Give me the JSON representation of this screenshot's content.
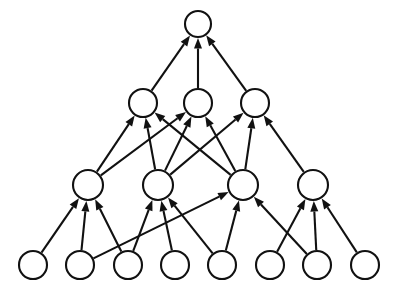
{
  "diagram": {
    "title": "",
    "type": "layered-directed-graph",
    "canvas": {
      "width": 396,
      "height": 288,
      "background": "#ffffff"
    },
    "style": {
      "node_fill": "#ffffff",
      "node_stroke": "#111111",
      "node_stroke_width": 2.1,
      "edge_color": "#111111",
      "edge_width": 2.1,
      "arrowhead": "filled-triangle"
    },
    "layers": [
      {
        "name": "output-layer",
        "index": 3,
        "y": 24,
        "radius": 13,
        "nodes": [
          {
            "id": "L3N1",
            "label": "",
            "x": 198,
            "y": 24,
            "r": 13
          }
        ]
      },
      {
        "name": "hidden-layer-2",
        "index": 2,
        "y": 103,
        "radius": 14,
        "nodes": [
          {
            "id": "L2N1",
            "label": "",
            "x": 143,
            "y": 103,
            "r": 14
          },
          {
            "id": "L2N2",
            "label": "",
            "x": 198,
            "y": 103,
            "r": 14
          },
          {
            "id": "L2N3",
            "label": "",
            "x": 255,
            "y": 103,
            "r": 14
          }
        ]
      },
      {
        "name": "hidden-layer-1",
        "index": 1,
        "y": 185,
        "radius": 15,
        "nodes": [
          {
            "id": "L1N1",
            "label": "",
            "x": 88,
            "y": 185,
            "r": 15
          },
          {
            "id": "L1N2",
            "label": "",
            "x": 158,
            "y": 185,
            "r": 15
          },
          {
            "id": "L1N3",
            "label": "",
            "x": 243,
            "y": 185,
            "r": 15
          },
          {
            "id": "L1N4",
            "label": "",
            "x": 313,
            "y": 185,
            "r": 15
          }
        ]
      },
      {
        "name": "input-layer",
        "index": 0,
        "y": 265,
        "radius": 14,
        "nodes": [
          {
            "id": "L0N1",
            "label": "",
            "x": 33,
            "y": 265,
            "r": 14
          },
          {
            "id": "L0N2",
            "label": "",
            "x": 80,
            "y": 265,
            "r": 14
          },
          {
            "id": "L0N3",
            "label": "",
            "x": 128,
            "y": 265,
            "r": 14
          },
          {
            "id": "L0N4",
            "label": "",
            "x": 175,
            "y": 265,
            "r": 14
          },
          {
            "id": "L0N5",
            "label": "",
            "x": 222,
            "y": 265,
            "r": 14
          },
          {
            "id": "L0N6",
            "label": "",
            "x": 270,
            "y": 265,
            "r": 14
          },
          {
            "id": "L0N7",
            "label": "",
            "x": 317,
            "y": 265,
            "r": 14
          },
          {
            "id": "L0N8",
            "label": "",
            "x": 365,
            "y": 265,
            "r": 14
          }
        ]
      }
    ],
    "edges": [
      {
        "from": "L0N1",
        "to": "L1N1"
      },
      {
        "from": "L0N2",
        "to": "L1N1"
      },
      {
        "from": "L0N3",
        "to": "L1N1"
      },
      {
        "from": "L0N2",
        "to": "L1N3"
      },
      {
        "from": "L0N3",
        "to": "L1N2"
      },
      {
        "from": "L0N4",
        "to": "L1N2"
      },
      {
        "from": "L0N5",
        "to": "L1N2"
      },
      {
        "from": "L0N5",
        "to": "L1N3"
      },
      {
        "from": "L0N7",
        "to": "L1N3"
      },
      {
        "from": "L0N6",
        "to": "L1N4"
      },
      {
        "from": "L0N7",
        "to": "L1N4"
      },
      {
        "from": "L0N8",
        "to": "L1N4"
      },
      {
        "from": "L1N1",
        "to": "L2N1"
      },
      {
        "from": "L1N2",
        "to": "L2N1"
      },
      {
        "from": "L1N3",
        "to": "L2N1"
      },
      {
        "from": "L1N1",
        "to": "L2N2"
      },
      {
        "from": "L1N2",
        "to": "L2N2"
      },
      {
        "from": "L1N3",
        "to": "L2N2"
      },
      {
        "from": "L1N2",
        "to": "L2N3"
      },
      {
        "from": "L1N3",
        "to": "L2N3"
      },
      {
        "from": "L1N4",
        "to": "L2N3"
      },
      {
        "from": "L2N1",
        "to": "L3N1"
      },
      {
        "from": "L2N2",
        "to": "L3N1"
      },
      {
        "from": "L2N3",
        "to": "L3N1"
      }
    ]
  }
}
